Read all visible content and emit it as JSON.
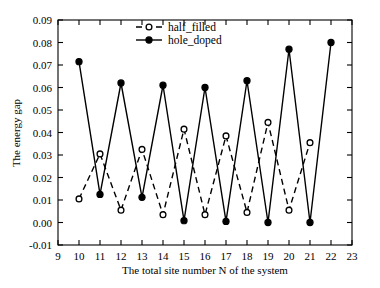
{
  "chart_data": {
    "type": "line",
    "title": "",
    "xlabel": "The total site number N of the system",
    "ylabel": "The energy gap",
    "xlim": [
      9,
      23
    ],
    "ylim": [
      -0.01,
      0.09
    ],
    "xticks": [
      9,
      10,
      11,
      12,
      13,
      14,
      15,
      16,
      17,
      18,
      19,
      20,
      21,
      22,
      23
    ],
    "xticklabels": [
      "9",
      "10",
      "11",
      "12",
      "13",
      "14",
      "15",
      "16",
      "17",
      "18",
      "19",
      "20",
      "21",
      "22",
      "23"
    ],
    "yticks": [
      -0.01,
      0.0,
      0.01,
      0.02,
      0.03,
      0.04,
      0.05,
      0.06,
      0.07,
      0.08,
      0.09
    ],
    "yticklabels": [
      "-0.01",
      "0.00",
      "0.01",
      "0.02",
      "0.03",
      "0.04",
      "0.05",
      "0.06",
      "0.07",
      "0.08",
      "0.09"
    ],
    "grid": false,
    "legend_position": "top-center",
    "series": [
      {
        "name": "half_filled",
        "style": "dashed",
        "marker": "open-circle",
        "color": "#000000",
        "x": [
          10,
          11,
          12,
          13,
          14,
          15,
          16,
          17,
          18,
          19,
          20,
          21
        ],
        "values": [
          0.0105,
          0.0305,
          0.0055,
          0.0325,
          0.0035,
          0.0415,
          0.0035,
          0.0385,
          0.0045,
          0.0445,
          0.0055,
          0.0355
        ]
      },
      {
        "name": "hole_doped",
        "style": "solid",
        "marker": "filled-circle",
        "color": "#000000",
        "x": [
          10,
          11,
          12,
          13,
          14,
          15,
          16,
          17,
          18,
          19,
          20,
          21,
          22
        ],
        "values": [
          0.0715,
          0.0125,
          0.062,
          0.0112,
          0.061,
          0.0008,
          0.06,
          0.0005,
          0.063,
          0.0,
          0.077,
          0.0,
          0.08
        ]
      }
    ],
    "legend": [
      {
        "label": "half_filled",
        "style": "dashed",
        "marker": "open-circle"
      },
      {
        "label": "hole_doped",
        "style": "solid",
        "marker": "filled-circle"
      }
    ]
  }
}
